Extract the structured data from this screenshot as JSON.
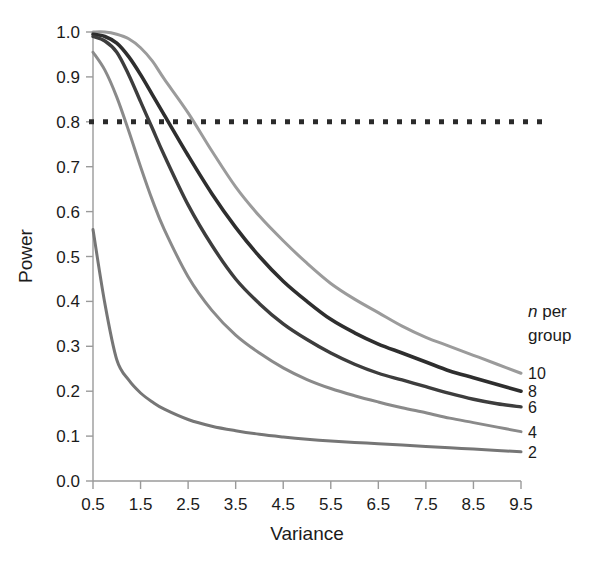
{
  "chart_data": {
    "type": "line",
    "title": "",
    "xlabel": "Variance",
    "ylabel": "Power",
    "xlim": [
      0.5,
      9.5
    ],
    "ylim": [
      0.0,
      1.0
    ],
    "grid": false,
    "legend_position": "right",
    "legend_title_line1": "n per",
    "legend_title_line2": "group",
    "legend_title_italic_token": "n",
    "x_ticks": [
      0.5,
      1.5,
      2.5,
      3.5,
      4.5,
      5.5,
      6.5,
      7.5,
      8.5,
      9.5
    ],
    "x_tick_labels": [
      "0.5",
      "1.5",
      "2.5",
      "3.5",
      "4.5",
      "5.5",
      "6.5",
      "7.5",
      "8.5",
      "9.5"
    ],
    "y_ticks": [
      0.0,
      0.1,
      0.2,
      0.3,
      0.4,
      0.5,
      0.6,
      0.7,
      0.8,
      0.9,
      1.0
    ],
    "y_tick_labels": [
      "0.0",
      "0.1",
      "0.2",
      "0.3",
      "0.4",
      "0.5",
      "0.6",
      "0.7",
      "0.8",
      "0.9",
      "1.0"
    ],
    "annotations": [
      {
        "name": "power-threshold",
        "type": "hline",
        "y": 0.8,
        "style": "dotted",
        "color": "#2a2a2a",
        "label": ""
      }
    ],
    "x": [
      0.5,
      0.75,
      1.0,
      1.25,
      1.5,
      1.75,
      2.0,
      2.5,
      3.0,
      3.5,
      4.0,
      4.5,
      5.0,
      5.5,
      6.0,
      6.5,
      7.0,
      7.5,
      8.0,
      8.5,
      9.0,
      9.5
    ],
    "series": [
      {
        "name": "10",
        "label": "10",
        "color": "#9b9b9b",
        "width": 3.0,
        "values": [
          1.0,
          1.0,
          0.995,
          0.985,
          0.965,
          0.935,
          0.895,
          0.82,
          0.735,
          0.655,
          0.59,
          0.535,
          0.485,
          0.44,
          0.405,
          0.375,
          0.345,
          0.32,
          0.3,
          0.28,
          0.26,
          0.24
        ]
      },
      {
        "name": "8",
        "label": "8",
        "color": "#2e2e2e",
        "width": 3.6,
        "values": [
          0.995,
          0.99,
          0.975,
          0.945,
          0.905,
          0.86,
          0.815,
          0.725,
          0.64,
          0.565,
          0.5,
          0.445,
          0.4,
          0.36,
          0.33,
          0.305,
          0.285,
          0.265,
          0.245,
          0.23,
          0.215,
          0.2
        ]
      },
      {
        "name": "6",
        "label": "6",
        "color": "#3d3d3d",
        "width": 3.4,
        "values": [
          0.99,
          0.98,
          0.955,
          0.905,
          0.845,
          0.785,
          0.725,
          0.615,
          0.525,
          0.45,
          0.395,
          0.35,
          0.315,
          0.285,
          0.26,
          0.24,
          0.225,
          0.21,
          0.195,
          0.182,
          0.172,
          0.165
        ]
      },
      {
        "name": "4",
        "label": "4",
        "color": "#8a8a8a",
        "width": 3.0,
        "values": [
          0.955,
          0.915,
          0.855,
          0.78,
          0.7,
          0.625,
          0.56,
          0.455,
          0.38,
          0.325,
          0.285,
          0.252,
          0.226,
          0.206,
          0.19,
          0.176,
          0.163,
          0.152,
          0.14,
          0.13,
          0.12,
          0.11
        ]
      },
      {
        "name": "2",
        "label": "2",
        "color": "#767676",
        "width": 3.0,
        "values": [
          0.56,
          0.395,
          0.27,
          0.225,
          0.196,
          0.176,
          0.16,
          0.137,
          0.122,
          0.112,
          0.104,
          0.098,
          0.093,
          0.089,
          0.086,
          0.083,
          0.08,
          0.077,
          0.074,
          0.071,
          0.068,
          0.065
        ]
      }
    ]
  }
}
